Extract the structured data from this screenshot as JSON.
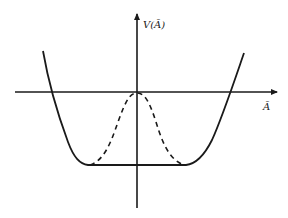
{
  "diagram": {
    "y_axis_label": "V(Ā)",
    "x_axis_label": "Ā",
    "colors": {
      "line": "#1a1a1a",
      "background": "#ffffff"
    },
    "curves": [
      {
        "name": "potential-solid",
        "style": "solid",
        "description": "flat-bottomed double-well potential"
      },
      {
        "name": "potential-dashed",
        "style": "dashed",
        "description": "central bump from origin down to the flat bottom"
      }
    ]
  }
}
